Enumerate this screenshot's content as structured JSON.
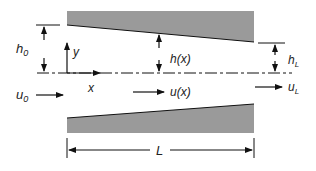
{
  "diagram": {
    "labels": {
      "h0": "h",
      "h0_sub": "0",
      "y": "y",
      "x": "x",
      "hx": "h(x)",
      "hL": "h",
      "hL_sub": "L",
      "u0": "u",
      "u0_sub": "0",
      "ux": "u(x)",
      "uL": "u",
      "uL_sub": "L",
      "L": "L"
    },
    "colors": {
      "plate": "#9a9a9a",
      "line": "#111111"
    }
  }
}
